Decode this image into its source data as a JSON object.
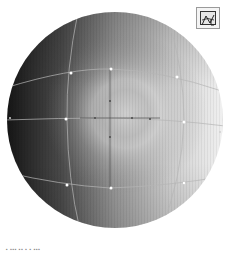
{
  "figure": {
    "type": "gradient-mesh-sphere",
    "background": "#ffffff",
    "sphere": {
      "cx": 115,
      "cy": 120,
      "r": 108,
      "colors": {
        "shadow": "#1e1e1e",
        "mid": "#7a7a7a",
        "light": "#d4d4d4",
        "highlight": "#e8e8e8",
        "edge_light": "#f2f2f2"
      }
    },
    "mesh_color": "#b8b8b8",
    "anchor_color": "#ffffff",
    "center_guide_color": "#3a3a3a"
  },
  "toolbar": {
    "icon": "mesh-tool-icon"
  },
  "caption": {
    "text": "▪ ▪▪▪ ▪▪ ▪ ▪ ▪▪▪"
  }
}
